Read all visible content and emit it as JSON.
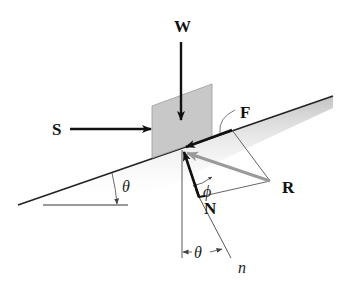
{
  "diagram": {
    "colors": {
      "block_fill": "#c8c8c8",
      "force_black": "#111111",
      "resultant_gray": "#9a9a9a",
      "incline_shadow": "#d4d4d4",
      "thin_line": "#555555"
    },
    "forces": [
      {
        "id": "W",
        "label": "W",
        "description": "weight, vertical downward"
      },
      {
        "id": "S",
        "label": "S",
        "description": "horizontal push"
      },
      {
        "id": "F",
        "label": "F",
        "description": "friction along incline"
      },
      {
        "id": "N",
        "label": "N",
        "description": "normal force"
      },
      {
        "id": "R",
        "label": "R",
        "description": "resultant reaction (gray)"
      }
    ],
    "angles": {
      "phi": "ϕ",
      "theta_incline": "θ",
      "theta_normal": "θ"
    },
    "axis_label": "n"
  }
}
